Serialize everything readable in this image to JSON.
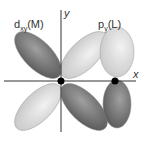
{
  "diagram": {
    "labels": {
      "metal_orbital": {
        "main": "d",
        "sub": "xy",
        "suffix": "(M)"
      },
      "ligand_orbital": {
        "main": "p",
        "sub": "y",
        "suffix": "(L)"
      }
    },
    "axes": {
      "x": "x",
      "y": "y"
    },
    "colors": {
      "dark_lobe": "#6e6e6e",
      "light_lobe": "#d8d8d8",
      "axis": "#333333",
      "nucleus": "#000000"
    }
  }
}
